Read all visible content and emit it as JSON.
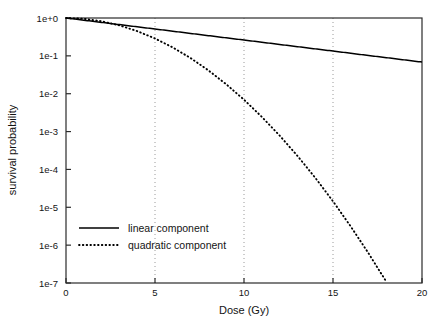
{
  "chart_data": {
    "type": "line",
    "title": "",
    "xlabel": "Dose (Gy)",
    "ylabel": "survival probability",
    "xlim": [
      0,
      20
    ],
    "ylim": [
      1e-07,
      1
    ],
    "yscale": "log",
    "xscale": "linear",
    "xticks": [
      0,
      5,
      10,
      15,
      20
    ],
    "xticklabels": [
      "0",
      "5",
      "10",
      "15",
      "20"
    ],
    "yticks": [
      1,
      0.1,
      0.01,
      0.001,
      0.0001,
      1e-05,
      1e-06,
      1e-07
    ],
    "yticklabels": [
      "1e+0",
      "1e-1",
      "1e-2",
      "1e-3",
      "1e-4",
      "1e-5",
      "1e-6",
      "1e-7"
    ],
    "grid": "vertical dotted gridlines at x = 5, 10, 15",
    "legend_position": "lower left inside axes",
    "series": [
      {
        "name": "linear component",
        "style": "solid",
        "color": "#000000",
        "formula": "exp(-0.134 * d)",
        "x": [
          0,
          1,
          2,
          3,
          4,
          5,
          6,
          7,
          8,
          9,
          10,
          11,
          12,
          13,
          14,
          15,
          16,
          17,
          18,
          19,
          20
        ],
        "y": [
          1.0,
          0.875,
          0.765,
          0.669,
          0.585,
          0.512,
          0.448,
          0.391,
          0.342,
          0.299,
          0.262,
          0.229,
          0.2,
          0.175,
          0.153,
          0.134,
          0.117,
          0.102,
          0.0896,
          0.0783,
          0.0685
        ]
      },
      {
        "name": "quadratic component",
        "style": "dotted",
        "color": "#000000",
        "formula": "exp(-0.0497 * d^2)",
        "x": [
          0,
          1,
          2,
          3,
          4,
          5,
          6,
          7,
          8,
          9,
          10,
          11,
          12,
          13,
          14,
          15,
          16,
          17,
          18
        ],
        "y": [
          1.0,
          0.9515,
          0.8194,
          0.6389,
          0.4504,
          0.2877,
          0.1666,
          0.0873,
          0.0414,
          0.01779,
          0.00694,
          0.002452,
          0.000787,
          0.0002291,
          6.04e-05,
          1.44e-05,
          3.1e-06,
          6.05e-07,
          1.07e-07
        ]
      }
    ],
    "annotations": []
  },
  "legend": {
    "items": [
      {
        "label": "linear component",
        "style": "solid"
      },
      {
        "label": "quadratic component",
        "style": "dotted"
      }
    ]
  }
}
